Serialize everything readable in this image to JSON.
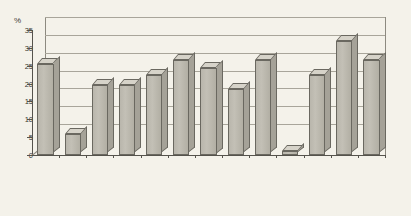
{
  "chart_data": {
    "type": "bar",
    "title": "",
    "xlabel": "",
    "ylabel": "%",
    "ylim": [
      0,
      35
    ],
    "ytick_step": 5,
    "yticks": [
      "0",
      "5",
      "10",
      "15",
      "20",
      "25",
      "30",
      "35"
    ],
    "grid": true,
    "legend": "none",
    "style_note": "3D extruded vertical bars, single series, scanned grayscale figure",
    "categories": [
      "Algeria",
      "Egypt",
      "Iran",
      "Iraq",
      "Israel",
      "Kuwait",
      "Lebanon",
      "Libya",
      "Morocco",
      "Sudan",
      "Syria",
      "Tunisia",
      "Yemen"
    ],
    "values": [
      25.5,
      6,
      19.5,
      19.5,
      22.5,
      26.5,
      24.5,
      18.5,
      26.5,
      1,
      22.5,
      32,
      26.5
    ],
    "series": [
      {
        "name": "",
        "values": [
          25.5,
          6,
          19.5,
          19.5,
          22.5,
          26.5,
          24.5,
          18.5,
          26.5,
          1,
          22.5,
          32,
          26.5
        ]
      }
    ]
  },
  "colors": {
    "background": "#f4f2ea",
    "bar_front": "#b9b6ac",
    "bar_top": "#d6d3c9",
    "bar_side": "#a5a298",
    "bar_outline": "#6a6860",
    "gridline": "#a8a59a",
    "axis": "#55534c",
    "text": "#2f2e2a"
  }
}
